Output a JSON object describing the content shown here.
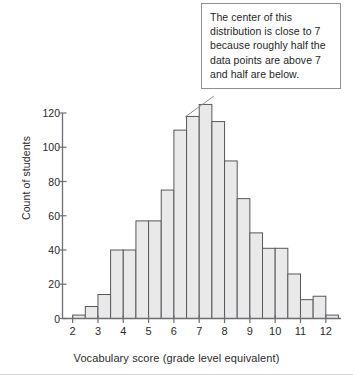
{
  "chart_data": {
    "type": "bar",
    "title": "",
    "xlabel": "Vocabulary score (grade level equivalent)",
    "ylabel": "Count of students",
    "xlim": [
      1.6,
      12.6
    ],
    "ylim": [
      0,
      130
    ],
    "grid": false,
    "legend": null,
    "bin_width": 0.5,
    "xticks": [
      2,
      3,
      4,
      5,
      6,
      7,
      8,
      9,
      10,
      11,
      12
    ],
    "xtick_labels": [
      "2",
      "3",
      "4",
      "5",
      "6",
      "7",
      "8",
      "9",
      "10",
      "11",
      "12"
    ],
    "yticks": [
      0,
      20,
      40,
      60,
      80,
      100,
      120
    ],
    "ytick_labels": [
      "0",
      "20",
      "40",
      "60",
      "80",
      "100",
      "120"
    ],
    "bin_starts": [
      2.0,
      2.5,
      3.0,
      3.5,
      4.0,
      4.5,
      5.0,
      5.5,
      6.0,
      6.5,
      7.0,
      7.5,
      8.0,
      8.5,
      9.0,
      9.5,
      10.0,
      10.5,
      11.0,
      11.5,
      12.0
    ],
    "categories": [
      "2.0-2.5",
      "2.5-3.0",
      "3.0-3.5",
      "3.5-4.0",
      "4.0-4.5",
      "4.5-5.0",
      "5.0-5.5",
      "5.5-6.0",
      "6.0-6.5",
      "6.5-7.0",
      "7.0-7.5",
      "7.5-8.0",
      "8.0-8.5",
      "8.5-9.0",
      "9.0-9.5",
      "9.5-10.0",
      "10.0-10.5",
      "10.5-11.0",
      "11.0-11.5",
      "11.5-12.0",
      "12.0-12.5"
    ],
    "values": [
      2,
      7,
      14,
      40,
      40,
      57,
      57,
      75,
      110,
      118,
      125,
      115,
      92,
      70,
      50,
      41,
      41,
      26,
      11,
      13,
      2
    ],
    "bar_fill": "#e9e9e9",
    "bar_stroke": "#58585c",
    "axis_color": "#6e6e73"
  },
  "callout": {
    "text": "The center of this distribution is close to 7 because roughly half the data points are above 7 and half are below.",
    "border_color": "#8e8e96"
  }
}
